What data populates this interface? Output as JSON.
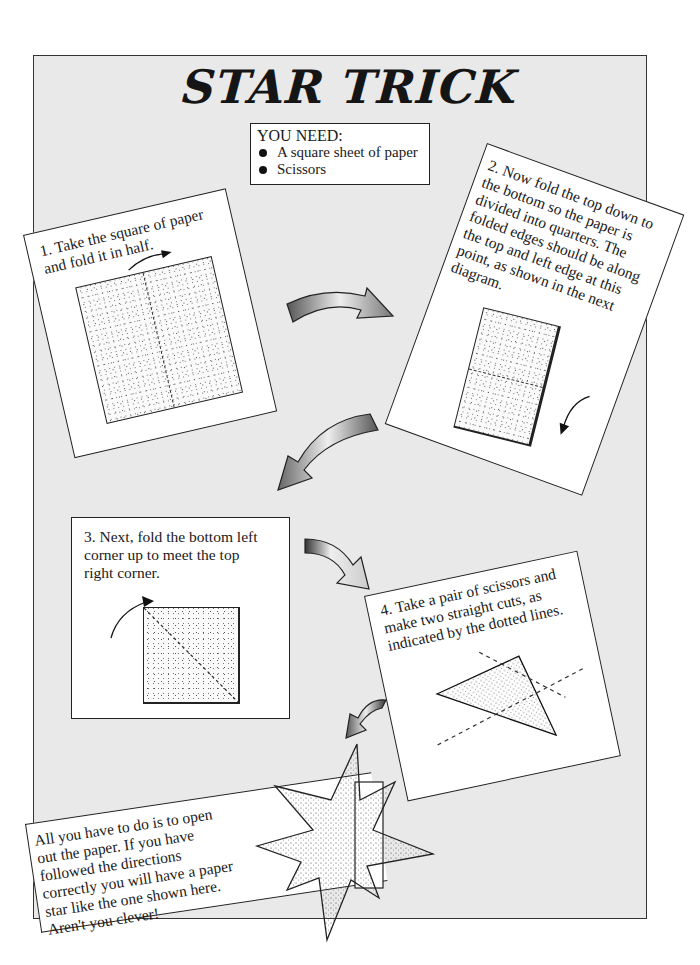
{
  "page": {
    "title": "STAR TRICK",
    "you_need": {
      "heading": "YOU NEED:",
      "items": [
        "A square sheet of paper",
        "Scissors"
      ]
    },
    "steps": [
      {
        "number": 1,
        "lines": [
          "1. Take the square of paper",
          "and fold it in half."
        ]
      },
      {
        "number": 2,
        "lines": [
          "2. Now fold the top down to",
          "the bottom so the paper is",
          "divided into quarters. The",
          "folded edges should be along",
          "the top and left edge at this",
          "point, as shown in the next",
          "diagram."
        ]
      },
      {
        "number": 3,
        "lines": [
          "3. Next, fold the bottom left",
          "corner up to meet the top",
          "right corner."
        ]
      },
      {
        "number": 4,
        "lines": [
          "4. Take a pair of scissors and",
          "make two straight cuts, as",
          "indicated by the dotted lines."
        ]
      }
    ],
    "conclusion": {
      "lines": [
        "All you have to do is to open",
        "out the paper. If you have",
        "followed the directions",
        "correctly you will have a paper",
        "star like the one shown here.",
        "Aren't you clever!"
      ]
    },
    "colors": {
      "panel_background": "#e9e9e9",
      "card_background": "#ffffff",
      "ink": "#1a1a1a"
    },
    "icons": [
      "curved-arrow-icon",
      "fold-arrow-icon",
      "paper-square-illustration",
      "star-illustration",
      "scissors-cut-lines"
    ]
  }
}
